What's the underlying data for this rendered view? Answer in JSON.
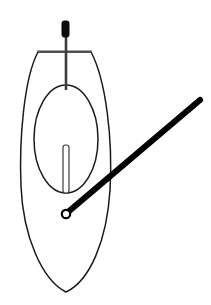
{
  "figure": {
    "canvas": {
      "width": 211,
      "height": 305,
      "background": "#ffffff"
    },
    "colors": {
      "outline": "#1a1a1a",
      "thin_line": "#4a4a4a",
      "shaft": "#3c3c3c",
      "grip_fill": "#0d0d0d",
      "rod": "#000000",
      "ring_fill": "#ffffff",
      "slot_fill": "#ffffff"
    },
    "parts": {
      "outer_body": {
        "name": "outer-oval-body",
        "type": "closed-curve",
        "center_x": 66,
        "center_y": 172,
        "left_x": 19,
        "right_x": 112,
        "top_y": 50,
        "bottom_y": 293,
        "path": "M 38 52 C 24 78, 19 140, 21 186 C 23 236, 42 280, 66 292 C 90 281, 107 240, 110 190 C 113 140, 106 80, 91 52 Z",
        "stroke_width": 1.5
      },
      "crossbar": {
        "name": "top-horizontal-crossbar",
        "type": "line",
        "x1": 37,
        "y1": 51,
        "x2": 92,
        "y2": 51,
        "stroke_width": 1.2
      },
      "inner_ellipse": {
        "name": "inner-ellipse",
        "type": "ellipse",
        "cx": 66,
        "cy": 139,
        "rx": 32,
        "ry": 54,
        "stroke_width": 1.4
      },
      "shaft": {
        "name": "vertical-shaft",
        "type": "line",
        "x1": 66,
        "y1": 36,
        "x2": 66,
        "y2": 90,
        "stroke_width": 2.6
      },
      "grip": {
        "name": "shaft-grip-handle",
        "type": "rounded-rect",
        "x": 62,
        "y": 21,
        "width": 7,
        "height": 16,
        "corner_radius": 2,
        "fill": "#0d0d0d"
      },
      "slot": {
        "name": "vertical-slot",
        "type": "rounded-rect",
        "x": 63,
        "y": 145,
        "width": 6,
        "height": 48,
        "corner_radius": 2.5,
        "fill": "#ffffff"
      },
      "rod": {
        "name": "diagonal-rod",
        "type": "line",
        "x1": 68,
        "y1": 212,
        "x2": 200,
        "y2": 100,
        "stroke_width": 6.2,
        "angle_degrees": -40
      },
      "ring": {
        "name": "rod-end-ring",
        "type": "circle",
        "cx": 66,
        "cy": 214,
        "r": 4.2,
        "stroke_width": 2.2,
        "fill": "#ffffff"
      }
    }
  }
}
